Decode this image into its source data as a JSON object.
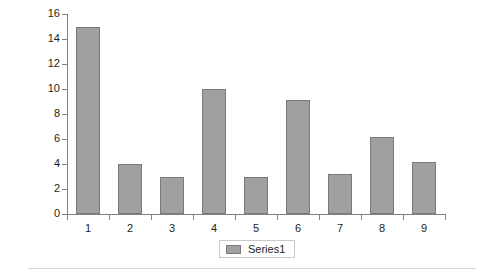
{
  "chart_data": {
    "type": "bar",
    "title": "",
    "subtitle": "",
    "xlabel": "",
    "ylabel": "",
    "categories": [
      "1",
      "2",
      "3",
      "4",
      "5",
      "6",
      "7",
      "8",
      "9"
    ],
    "series": [
      {
        "name": "Series1",
        "values": [
          15.0,
          4.0,
          3.0,
          10.0,
          3.0,
          9.1,
          3.2,
          6.2,
          4.2
        ]
      }
    ],
    "ylim": [
      0,
      16
    ],
    "ytick_values": [
      0,
      2,
      4,
      6,
      8,
      10,
      12,
      14,
      16
    ],
    "ytick_labels": [
      "0",
      "2",
      "4",
      "6",
      "8",
      "10",
      "12",
      "14",
      "16"
    ],
    "grid": false,
    "legend": {
      "position": "bottom",
      "entries": [
        "Series1"
      ]
    },
    "colors": {
      "bar_fill": "#a0a0a0",
      "bar_border": "#7a7a7a",
      "axis": "#808080",
      "text": "#231f20",
      "background": "#ffffff",
      "legend_border": "#c9c9c9",
      "bottom_rule": "#d7d7d7"
    }
  }
}
